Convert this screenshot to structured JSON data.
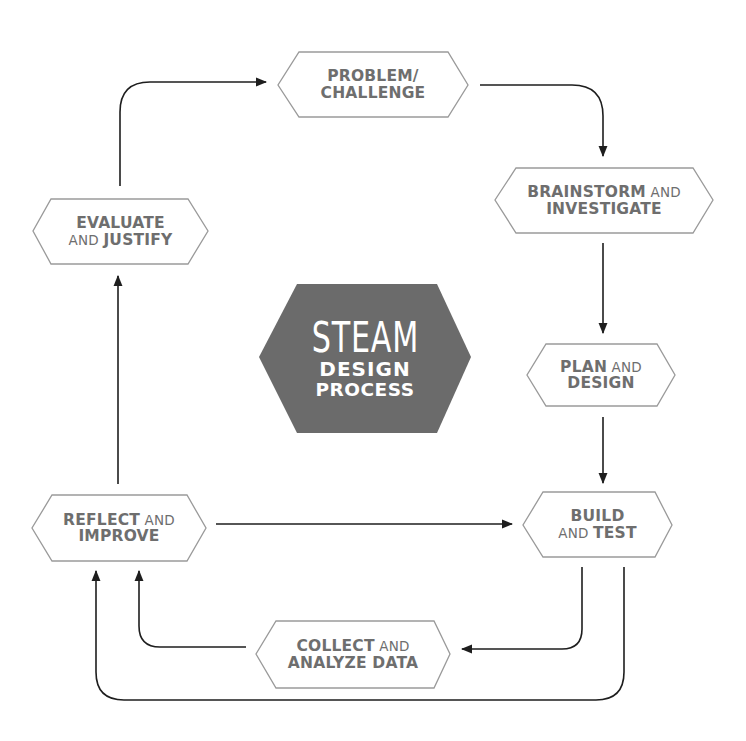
{
  "title": {
    "line1": "STEAM",
    "line2": "DESIGN",
    "line3": "PROCESS"
  },
  "colors": {
    "center_fill": "#6b6b6b",
    "outline": "#9a9a9a",
    "text": "#6e6e6e",
    "arrow": "#1e1e1e",
    "background": "#ffffff"
  },
  "nodes": {
    "problem": {
      "parts": [
        [
          "PROBLEM/",
          ""
        ],
        [
          "CHALLENGE",
          ""
        ]
      ],
      "line1_bold": "PROBLEM/",
      "line1_light": "",
      "line2_bold": "CHALLENGE",
      "line2_light": ""
    },
    "brainstorm": {
      "line1_bold": "BRAINSTORM",
      "line1_light": " AND",
      "line2_bold": "INVESTIGATE",
      "line2_light": ""
    },
    "plan": {
      "line1_bold": "PLAN",
      "line1_light": " AND",
      "line2_bold": "DESIGN",
      "line2_light": ""
    },
    "build": {
      "line1_bold": "BUILD",
      "line1_light": "",
      "line2_light": "AND ",
      "line2_bold": "TEST"
    },
    "collect": {
      "line1_bold": "COLLECT",
      "line1_light": " AND",
      "line2_bold": "ANALYZE DATA",
      "line2_light": ""
    },
    "reflect": {
      "line1_bold": "REFLECT",
      "line1_light": " AND",
      "line2_bold": "IMPROVE",
      "line2_light": ""
    },
    "evaluate": {
      "line1_bold": "EVALUATE",
      "line1_light": "",
      "line2_light": "AND ",
      "line2_bold": "JUSTIFY"
    }
  },
  "edges": [
    {
      "from": "evaluate",
      "to": "problem"
    },
    {
      "from": "problem",
      "to": "brainstorm"
    },
    {
      "from": "brainstorm",
      "to": "plan"
    },
    {
      "from": "plan",
      "to": "build"
    },
    {
      "from": "build",
      "to": "collect"
    },
    {
      "from": "collect",
      "to": "reflect"
    },
    {
      "from": "build",
      "to": "reflect"
    },
    {
      "from": "reflect",
      "to": "build"
    },
    {
      "from": "reflect",
      "to": "evaluate"
    }
  ]
}
